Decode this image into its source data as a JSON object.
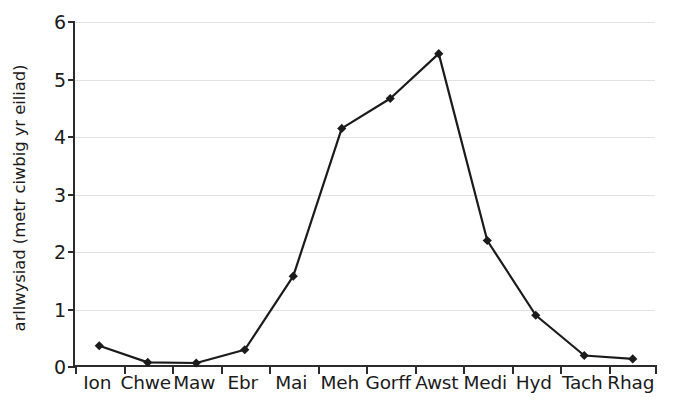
{
  "chart_data": {
    "type": "line",
    "title": "",
    "xlabel": "",
    "ylabel": "arllwysiad (metr ciwbig yr eiliad)",
    "categories": [
      "Ion",
      "Chwe",
      "Maw",
      "Ebr",
      "Mai",
      "Meh",
      "Gorff",
      "Awst",
      "Medi",
      "Hyd",
      "Tach",
      "Rhag"
    ],
    "values": [
      0.37,
      0.08,
      0.07,
      0.3,
      1.58,
      4.15,
      4.67,
      5.45,
      2.2,
      0.9,
      0.2,
      0.14
    ],
    "series": [
      {
        "name": "arllwysiad",
        "values": [
          0.37,
          0.08,
          0.07,
          0.3,
          1.58,
          4.15,
          4.67,
          5.45,
          2.2,
          0.9,
          0.2,
          0.14
        ]
      }
    ],
    "ylim": [
      0,
      6
    ],
    "y_ticks": [
      0,
      1,
      2,
      3,
      4,
      5,
      6
    ],
    "y_tick_labels": [
      "0",
      "1",
      "2",
      "3",
      "4",
      "5",
      "6"
    ],
    "grid": true,
    "grid_axis": "y",
    "legend": false,
    "legend_position": "none",
    "marker": "diamond",
    "line_color": "#1b1b1b",
    "marker_color": "#1b1b1b",
    "grid_color": "#e2e2e2",
    "axis_color": "#2b2b2b",
    "background_color": "#ffffff"
  }
}
